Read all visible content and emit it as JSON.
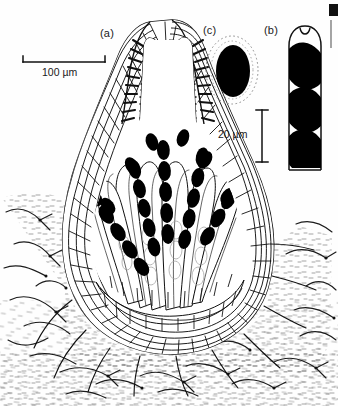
{
  "figure": {
    "kind": "scientific-line-drawing",
    "background_color": "#fefefe",
    "ink_color": "#111111"
  },
  "panels": [
    {
      "id": "a",
      "label": "(a)",
      "x": 100,
      "y": 27,
      "caption_subject": "vertical section of perithecium embedded in substrate"
    },
    {
      "id": "c",
      "label": "(c)",
      "x": 203,
      "y": 24,
      "caption_subject": "single ascospore with gelatinous sheath"
    },
    {
      "id": "b",
      "label": "(b)",
      "x": 264,
      "y": 24,
      "caption_subject": "ascus containing three ascospores"
    }
  ],
  "scale_bars": [
    {
      "id": "scale-100um",
      "label": "100 µm",
      "orientation": "horizontal",
      "x1": 23,
      "x2": 105,
      "y": 62,
      "label_x": 64,
      "label_y": 68
    },
    {
      "id": "scale-20um",
      "label": "20 µm",
      "orientation": "vertical",
      "x": 262,
      "y1": 110,
      "y2": 162,
      "label_x": 252,
      "label_y": 136
    }
  ],
  "colors": {
    "ink": "#111111",
    "spore_fill": "#000000",
    "paper": "#fefefe",
    "stipple": "#3a3a3a",
    "margin_rule": "#8e8e8e"
  },
  "structures": {
    "ostiole": "apical canal lined with periphyses",
    "wall": "multilayered pseudoparenchymatous peridium",
    "centrum": "radiating cylindrical asci with uniseriate black ascospores",
    "substrate": "stippled matrix with scattered branching hyphae"
  }
}
